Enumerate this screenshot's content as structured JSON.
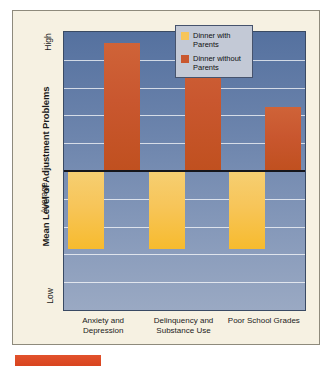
{
  "figure": {
    "y_axis_title": "Mean Level of Adjustment Problems"
  },
  "legend": {
    "items": [
      {
        "label": "Dinner with Parents",
        "color": "#f7c559",
        "name": "dinner-with-parents"
      },
      {
        "label": "Dinner without Parents",
        "color": "#c9572f",
        "name": "dinner-without-parents"
      }
    ]
  },
  "chart_data": {
    "type": "bar",
    "title": "",
    "subtitle": "",
    "xlabel": "",
    "ylabel": "Mean Level of Adjustment Problems",
    "categories": [
      "Anxiety and Depression",
      "Delinquency and Substance Use",
      "Poor School Grades"
    ],
    "y_tick_labels": [
      "High",
      "Average",
      "Low"
    ],
    "ylim": [
      -1.0,
      1.0
    ],
    "baseline": 0,
    "grid": true,
    "gridlines_y": [
      0.8,
      0.6,
      0.4,
      0.2,
      -0.2,
      -0.4,
      -0.6,
      -0.8
    ],
    "legend_position": "top-right",
    "series": [
      {
        "name": "Dinner with Parents",
        "color": "#f7c559",
        "values": [
          -0.56,
          -0.56,
          -0.56
        ]
      },
      {
        "name": "Dinner without Parents",
        "color": "#c9572f",
        "values": [
          0.92,
          0.92,
          0.46
        ]
      }
    ]
  }
}
